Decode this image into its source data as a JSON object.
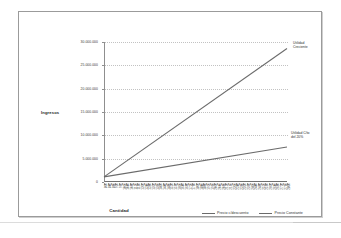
{
  "chart_data": {
    "type": "line",
    "title": "",
    "xlabel": "Cantidad",
    "ylabel": "Ingresos",
    "ylim": [
      0,
      30000000
    ],
    "grid": true,
    "legend_position": "bottom",
    "y_ticks": [
      "30.000.000",
      "25.000.000",
      "20.000.000",
      "15.000.000",
      "10.000.000",
      "5.000.000",
      "0"
    ],
    "y_tick_values": [
      30000000,
      25000000,
      20000000,
      15000000,
      10000000,
      5000000,
      0
    ],
    "categories": [
      "800",
      "840",
      "880",
      "920",
      "960",
      "1000",
      "1040",
      "1080",
      "1120",
      "1160",
      "1200",
      "1240",
      "1280",
      "1320",
      "1360",
      "1400",
      "1440",
      "1480",
      "1520",
      "1560",
      "1600",
      "1640",
      "1680",
      "1720",
      "1760",
      "1800",
      "1840",
      "1880",
      "1920",
      "1960",
      "2000",
      "2040",
      "2080",
      "2120",
      "2160",
      "2200",
      "2240",
      "2280",
      "2320",
      "2360",
      "2400",
      "2440",
      "2480",
      "2520",
      "2560",
      "2600",
      "2640",
      "2680",
      "2720",
      "2760",
      "2800"
    ],
    "series": [
      {
        "name": "Precio c/descuento",
        "color": "#6b6b6b",
        "start_value": 1100000,
        "end_value": 28600000
      },
      {
        "name": "Precio Constante",
        "color": "#6b6b6b",
        "start_value": 1100000,
        "end_value": 7500000
      }
    ],
    "annotations": [
      {
        "name": "utilidad-creciente",
        "text": "Utilidad\nCreciente"
      },
      {
        "name": "utilidad-descuento",
        "text": "Utilidad C/to\ndel 20%"
      }
    ]
  },
  "legend": {
    "items": [
      {
        "label": "Precio c/descuento"
      },
      {
        "label": "Precio Constante"
      }
    ]
  }
}
